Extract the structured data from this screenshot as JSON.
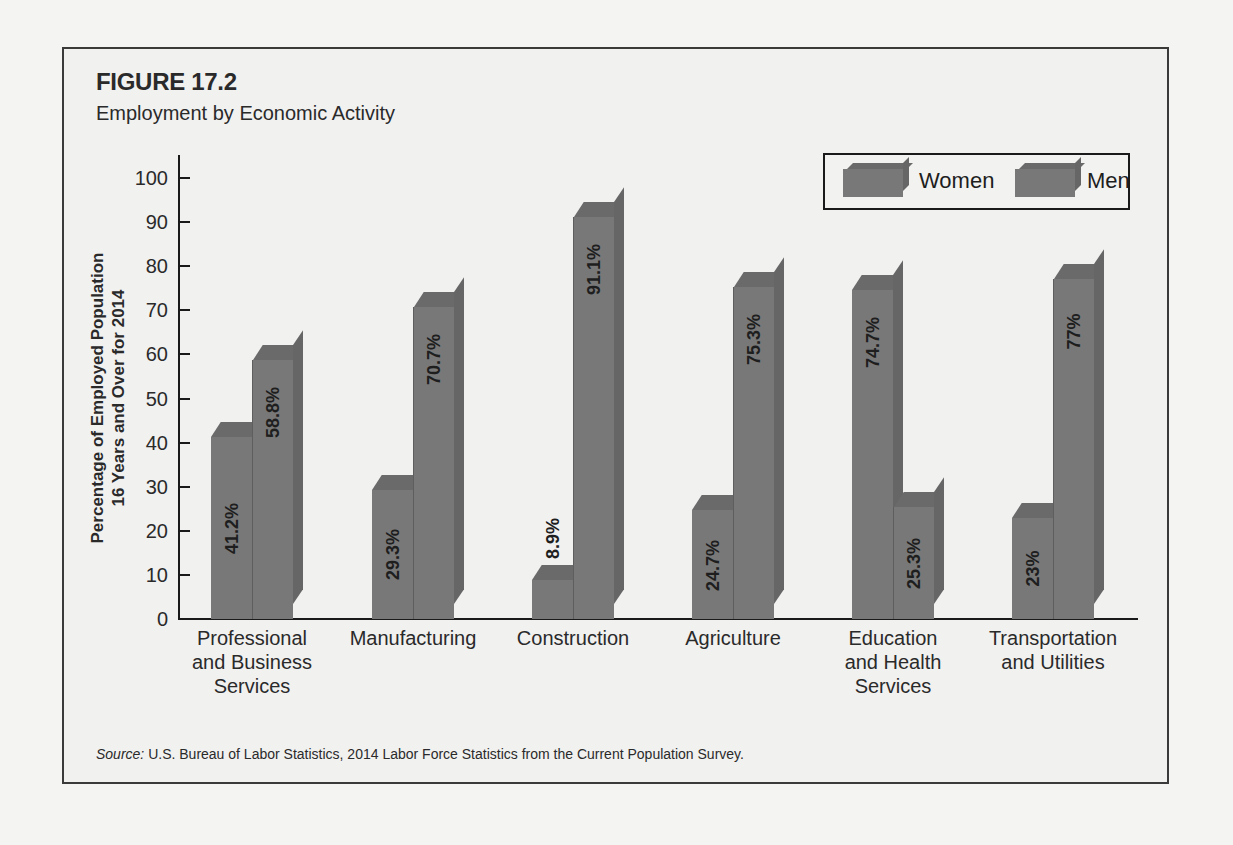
{
  "figure": {
    "label": "FIGURE 17.2",
    "title": "Employment by Economic Activity",
    "source_prefix": "Source:",
    "source_text": " U.S. Bureau of Labor Statistics, 2014 Labor Force Statistics from the Current Population Survey."
  },
  "axis": {
    "ylabel_line1": "Percentage of Employed Population",
    "ylabel_line2": "16 Years and Over for 2014",
    "ticks": [
      "0",
      "10",
      "20",
      "30",
      "40",
      "50",
      "60",
      "70",
      "80",
      "90",
      "100"
    ]
  },
  "legend": {
    "women": "Women",
    "men": "Men"
  },
  "colors": {
    "bar_front": "#787878",
    "bar_top": "#6a6a6a",
    "bar_side": "#666666",
    "frame": "#3a3a3a"
  },
  "categories": [
    {
      "label": "Professional\nand Business\nServices",
      "women": 41.2,
      "men": 58.8,
      "women_label": "41.2%",
      "men_label": "58.8%"
    },
    {
      "label": "Manufacturing",
      "women": 29.3,
      "men": 70.7,
      "women_label": "29.3%",
      "men_label": "70.7%"
    },
    {
      "label": "Construction",
      "women": 8.9,
      "men": 91.1,
      "women_label": "8.9%",
      "men_label": "91.1%"
    },
    {
      "label": "Agriculture",
      "women": 24.7,
      "men": 75.3,
      "women_label": "24.7%",
      "men_label": "75.3%"
    },
    {
      "label": "Education\nand Health\nServices",
      "women": 74.7,
      "men": 25.3,
      "women_label": "74.7%",
      "men_label": "25.3%"
    },
    {
      "label": "Transportation\nand Utilities",
      "women": 23,
      "men": 77,
      "women_label": "23%",
      "men_label": "77%"
    }
  ],
  "chart_data": {
    "type": "bar",
    "title": "Employment by Economic Activity",
    "subtitle": "FIGURE 17.2",
    "categories": [
      "Professional and Business Services",
      "Manufacturing",
      "Construction",
      "Agriculture",
      "Education and Health Services",
      "Transportation and Utilities"
    ],
    "series": [
      {
        "name": "Women",
        "values": [
          41.2,
          29.3,
          8.9,
          24.7,
          74.7,
          23
        ]
      },
      {
        "name": "Men",
        "values": [
          58.8,
          70.7,
          91.1,
          75.3,
          25.3,
          77
        ]
      }
    ],
    "xlabel": "",
    "ylabel": "Percentage of Employed Population 16 Years and Over for 2014",
    "ylim": [
      0,
      100
    ],
    "yticks": [
      0,
      10,
      20,
      30,
      40,
      50,
      60,
      70,
      80,
      90,
      100
    ],
    "grid": false,
    "legend_position": "top-right",
    "style": "3d-bar, both series same gray",
    "data_labels": [
      "41.2%",
      "58.8%",
      "29.3%",
      "70.7%",
      "8.9%",
      "91.1%",
      "24.7%",
      "75.3%",
      "74.7%",
      "25.3%",
      "23%",
      "77%"
    ],
    "source": "Source: U.S. Bureau of Labor Statistics, 2014 Labor Force Statistics from the Current Population Survey."
  }
}
